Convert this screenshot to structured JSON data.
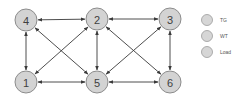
{
  "diagram": {
    "type": "network-graph",
    "nodes": [
      {
        "id": "4",
        "label": "4",
        "x": 26,
        "y": 20
      },
      {
        "id": "2",
        "label": "2",
        "x": 97,
        "y": 19
      },
      {
        "id": "3",
        "label": "3",
        "x": 170,
        "y": 19
      },
      {
        "id": "1",
        "label": "1",
        "x": 26,
        "y": 82
      },
      {
        "id": "5",
        "label": "5",
        "x": 97,
        "y": 82
      },
      {
        "id": "6",
        "label": "6",
        "x": 170,
        "y": 82
      }
    ],
    "edges": [
      {
        "from": "4",
        "to": "2",
        "bidirectional": true
      },
      {
        "from": "2",
        "to": "3",
        "bidirectional": true
      },
      {
        "from": "1",
        "to": "5",
        "bidirectional": true
      },
      {
        "from": "5",
        "to": "6",
        "bidirectional": true
      },
      {
        "from": "4",
        "to": "1",
        "bidirectional": true
      },
      {
        "from": "2",
        "to": "5",
        "bidirectional": true
      },
      {
        "from": "3",
        "to": "6",
        "bidirectional": true
      },
      {
        "from": "4",
        "to": "5",
        "bidirectional": true
      },
      {
        "from": "2",
        "to": "1",
        "bidirectional": true
      },
      {
        "from": "2",
        "to": "6",
        "bidirectional": true
      },
      {
        "from": "3",
        "to": "5",
        "bidirectional": true
      }
    ],
    "node_radius": 11,
    "colors": {
      "node_fill": "#d3d3d3",
      "node_stroke": "#8c8c8c",
      "edge": "#3a3a3a",
      "label": "#404040"
    }
  },
  "legend": {
    "items": [
      {
        "label": "TG",
        "x": 207,
        "y": 20
      },
      {
        "label": "WT",
        "x": 207,
        "y": 36
      },
      {
        "label": "Load",
        "x": 207,
        "y": 52
      }
    ]
  }
}
